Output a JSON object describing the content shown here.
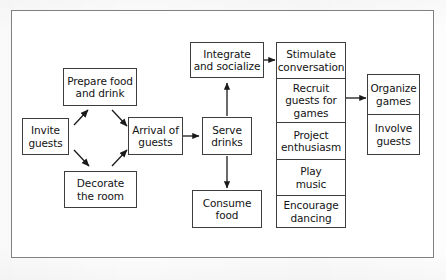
{
  "diagram": {
    "frame": {
      "stroke": "#7d8184"
    },
    "style": {
      "node_stroke": "#3d3d3d",
      "node_fill": "#ffffff",
      "text_color": "#131313"
    },
    "nodes": [
      {
        "id": "invite",
        "label": "Invite\nguests",
        "label_line1": "Invite",
        "label_line2": "guests"
      },
      {
        "id": "prepare",
        "label": "Prepare food\nand drink",
        "label_line1": "Prepare food",
        "label_line2": "and drink"
      },
      {
        "id": "decorate",
        "label": "Decorate\nthe room",
        "label_line1": "Decorate",
        "label_line2": "the room"
      },
      {
        "id": "arrival",
        "label": "Arrival of\nguests",
        "label_line1": "Arrival of",
        "label_line2": "guests"
      },
      {
        "id": "serve",
        "label": "Serve\ndrinks",
        "label_line1": "Serve",
        "label_line2": "drinks"
      },
      {
        "id": "consume",
        "label": "Consume\nfood",
        "label_line1": "Consume",
        "label_line2": "food"
      },
      {
        "id": "integrate",
        "label": "Integrate\nand socialize",
        "label_line1": "Integrate",
        "label_line2": "and socialize"
      }
    ],
    "activity_stack": [
      {
        "id": "stimulate",
        "label": "Stimulate\nconversation"
      },
      {
        "id": "recruit",
        "label": "Recruit\nguests for\ngames"
      },
      {
        "id": "project",
        "label": "Project\nenthusiasm"
      },
      {
        "id": "play",
        "label": "Play\nmusic"
      },
      {
        "id": "encourage",
        "label": "Encourage\ndancing"
      }
    ],
    "games_stack": [
      {
        "id": "organize",
        "label": "Organize\ngames"
      },
      {
        "id": "involve",
        "label": "Involve\nguests"
      }
    ],
    "edges": [
      {
        "from": "invite",
        "to": "prepare",
        "kind": "arrow-diagonal"
      },
      {
        "from": "invite",
        "to": "decorate",
        "kind": "arrow-diagonal"
      },
      {
        "from": "prepare",
        "to": "arrival",
        "kind": "arrow-diagonal"
      },
      {
        "from": "decorate",
        "to": "arrival",
        "kind": "arrow-diagonal"
      },
      {
        "from": "arrival",
        "to": "serve",
        "kind": "arrow-horizontal"
      },
      {
        "from": "serve",
        "to": "integrate",
        "kind": "arrow-up"
      },
      {
        "from": "serve",
        "to": "consume",
        "kind": "arrow-down"
      },
      {
        "from": "integrate",
        "to": "stimulate",
        "kind": "arrow-horizontal"
      },
      {
        "from": "recruit",
        "to": "organize",
        "kind": "arrow-horizontal"
      }
    ]
  }
}
